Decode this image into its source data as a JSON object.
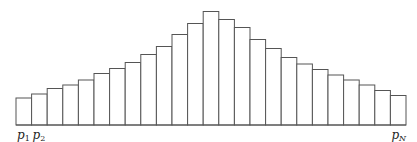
{
  "chart_data": {
    "type": "bar",
    "title": "",
    "xlabel": "",
    "ylabel": "",
    "grid": false,
    "legend": null,
    "bar_count": 25,
    "categories": [
      "p1",
      "p2",
      "p3",
      "p4",
      "p5",
      "p6",
      "p7",
      "p8",
      "p9",
      "p10",
      "p11",
      "p12",
      "p13",
      "p14",
      "p15",
      "p16",
      "p17",
      "p18",
      "p19",
      "p20",
      "p21",
      "p22",
      "p23",
      "p24",
      "pN"
    ],
    "values": [
      27,
      31,
      36.5,
      40,
      45,
      51.5,
      56.5,
      62.5,
      70.5,
      78.5,
      90.5,
      101.5,
      113.5,
      105.5,
      97.5,
      85.5,
      76.5,
      67.5,
      61,
      55.5,
      50,
      45,
      40,
      34.5,
      29.5
    ],
    "tick_labels": [
      {
        "base": "p",
        "sub": "1",
        "position": 0
      },
      {
        "base": "p",
        "sub": "2",
        "position": 1
      },
      {
        "base": "p",
        "sub": "N",
        "position": 24
      }
    ],
    "layout": {
      "x_start": 16,
      "x_end": 406,
      "baseline_y": 125
    },
    "colors": {
      "stroke": "#555555",
      "fill": "#ffffff"
    }
  }
}
